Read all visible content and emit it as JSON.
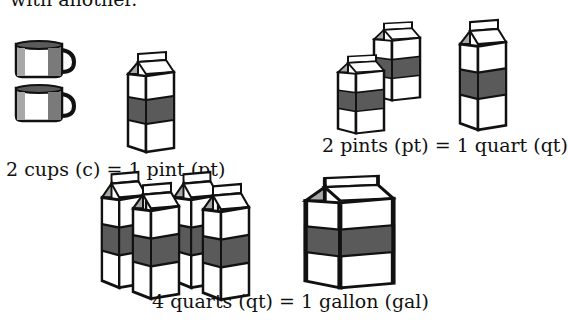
{
  "intro_text": "with another.",
  "colors": {
    "band": "#5a5a5a",
    "shade": "#a8a8a8",
    "outline": "#111111",
    "paper": "#ffffff"
  },
  "groups": [
    {
      "caption": "2 cups (c) = 1 pint (pt)",
      "left_items": [
        "cup",
        "cup"
      ],
      "right_items": [
        "pint carton"
      ]
    },
    {
      "caption": "2 pints (pt) = 1 quart (qt)",
      "left_items": [
        "pint carton",
        "pint carton"
      ],
      "right_items": [
        "quart carton"
      ]
    },
    {
      "caption": "4 quarts (qt) = 1 gallon (gal)",
      "left_items": [
        "quart carton",
        "quart carton",
        "quart carton",
        "quart carton"
      ],
      "right_items": [
        "gallon carton"
      ]
    }
  ]
}
